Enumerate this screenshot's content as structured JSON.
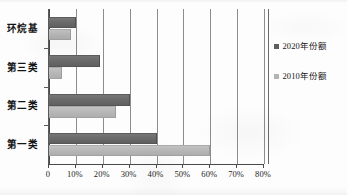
{
  "chart_data": {
    "type": "bar",
    "orientation": "horizontal",
    "title": "",
    "subtitle": "",
    "xlabel": "",
    "ylabel": "",
    "categories": [
      "第一类",
      "第二类",
      "第三类",
      "环烷基"
    ],
    "categories_top_to_bottom": [
      "环烷基",
      "第三类",
      "第二类",
      "第一类"
    ],
    "series": [
      {
        "name": "2020年份额",
        "color": "#6e6e6e",
        "values": [
          40,
          30,
          19,
          10
        ]
      },
      {
        "name": "2010年份额",
        "color": "#b9b9b9",
        "values": [
          60,
          25,
          5,
          8
        ]
      }
    ],
    "xlim": [
      0,
      80
    ],
    "xticks": [
      0,
      10,
      20,
      30,
      40,
      50,
      60,
      70,
      80
    ],
    "xticklabels": [
      "0",
      "10%",
      "20%",
      "30%",
      "40%",
      "50%",
      "60%",
      "70%",
      "80%"
    ],
    "grid": true,
    "grid_axis": "x",
    "legend_position": "right"
  },
  "axes": {
    "y_categories": [
      {
        "label": "环烷基"
      },
      {
        "label": "第三类"
      },
      {
        "label": "第二类"
      },
      {
        "label": "第一类"
      }
    ],
    "x_ticklabels": [
      {
        "text": "0",
        "value": 0
      },
      {
        "text": "10%",
        "value": 10
      },
      {
        "text": "20%",
        "value": 20
      },
      {
        "text": "30%",
        "value": 30
      },
      {
        "text": "40%",
        "value": 40
      },
      {
        "text": "50%",
        "value": 50
      },
      {
        "text": "60%",
        "value": 60
      },
      {
        "text": "70%",
        "value": 70
      },
      {
        "text": "80%",
        "value": 80
      }
    ]
  },
  "legend": {
    "entries": [
      {
        "label": "2020年份额",
        "color": "#6e6e6e"
      },
      {
        "label": "2010年份额",
        "color": "#b9b9b9"
      }
    ]
  },
  "colors": {
    "series_2020": "#6e6e6e",
    "series_2010": "#b9b9b9",
    "axis": "#4a4a4a",
    "gridline": "#8d8d8d",
    "background": "#fdfdfd",
    "text": "#151515"
  }
}
